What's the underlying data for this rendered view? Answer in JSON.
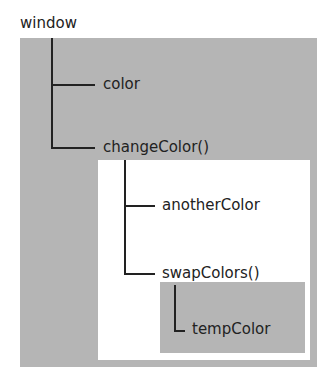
{
  "diagram": {
    "type": "scope-chain",
    "colors": {
      "outer_scope": "#b5b5b5",
      "middle_scope": "#ffffff",
      "inner_scope": "#b5b5b5",
      "line": "#222222",
      "text": "#222222"
    },
    "scopes": [
      {
        "name": "window",
        "label": "window",
        "children": [
          "color",
          "changeColor()"
        ]
      },
      {
        "name": "changeColor",
        "label": "changeColor()",
        "children": [
          "anotherColor",
          "swapColors()"
        ]
      },
      {
        "name": "swapColors",
        "label": "swapColors()",
        "children": [
          "tempColor"
        ]
      }
    ],
    "nodes": {
      "window": "window",
      "color": "color",
      "changeColor": "changeColor()",
      "anotherColor": "anotherColor",
      "swapColors": "swapColors()",
      "tempColor": "tempColor"
    }
  }
}
